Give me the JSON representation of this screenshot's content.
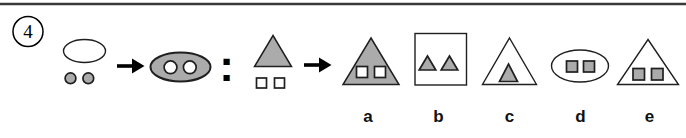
{
  "question": {
    "number": "4",
    "colon": ":",
    "premise_left_desc": "white ellipse outline with two small gray dots below",
    "premise_right_desc": "gray ellipse containing two white dots",
    "stem_desc": "gray triangle with two small white square outlines below",
    "arrow_icon": "right-arrow"
  },
  "options": [
    {
      "label": "a",
      "description": "gray triangle containing two white squares"
    },
    {
      "label": "b",
      "description": "white square outline containing two gray triangles"
    },
    {
      "label": "c",
      "description": "white triangle outline containing one gray triangle"
    },
    {
      "label": "d",
      "description": "white ellipse outline containing two gray squares"
    },
    {
      "label": "e",
      "description": "white triangle outline containing two gray squares"
    }
  ],
  "colors": {
    "shape-gray": "#ababab",
    "outline": "#1f1f1f",
    "rule": "#3a3a3a",
    "label": "#111111"
  }
}
